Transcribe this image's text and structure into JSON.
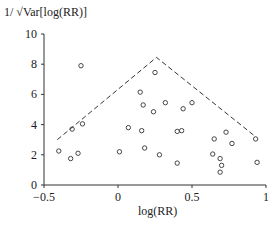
{
  "chart_data": {
    "type": "scatter",
    "title": "",
    "xlabel": "log(RR)",
    "ylabel": "1/ √Var[log(RR)]",
    "xlim": [
      -0.5,
      1
    ],
    "ylim": [
      0,
      10
    ],
    "xticks": [
      "-0.5",
      "0",
      "0.5",
      "1"
    ],
    "yticks": [
      "0",
      "2",
      "4",
      "6",
      "8",
      "10"
    ],
    "grid": false,
    "legend": null,
    "series": [
      {
        "name": "studies",
        "marker": "open-circle",
        "points": [
          [
            -0.25,
            7.9
          ],
          [
            -0.31,
            3.7
          ],
          [
            -0.24,
            4.05
          ],
          [
            -0.4,
            2.25
          ],
          [
            -0.27,
            2.1
          ],
          [
            -0.32,
            1.75
          ],
          [
            0.01,
            2.2
          ],
          [
            0.07,
            3.8
          ],
          [
            0.16,
            3.6
          ],
          [
            0.18,
            2.45
          ],
          [
            0.28,
            2.0
          ],
          [
            0.25,
            7.45
          ],
          [
            0.15,
            6.15
          ],
          [
            0.17,
            5.3
          ],
          [
            0.32,
            5.45
          ],
          [
            0.24,
            4.85
          ],
          [
            0.44,
            5.05
          ],
          [
            0.5,
            5.45
          ],
          [
            0.4,
            3.55
          ],
          [
            0.43,
            3.6
          ],
          [
            0.4,
            1.45
          ],
          [
            0.73,
            3.5
          ],
          [
            0.65,
            3.05
          ],
          [
            0.77,
            2.75
          ],
          [
            0.93,
            3.05
          ],
          [
            0.64,
            2.05
          ],
          [
            0.69,
            1.75
          ],
          [
            0.7,
            1.3
          ],
          [
            0.69,
            0.85
          ],
          [
            0.94,
            1.5
          ]
        ]
      },
      {
        "name": "funnel",
        "style": "dashed-line",
        "points": [
          [
            -0.41,
            3.0
          ],
          [
            0.26,
            8.45
          ],
          [
            0.93,
            3.2
          ]
        ]
      }
    ]
  }
}
